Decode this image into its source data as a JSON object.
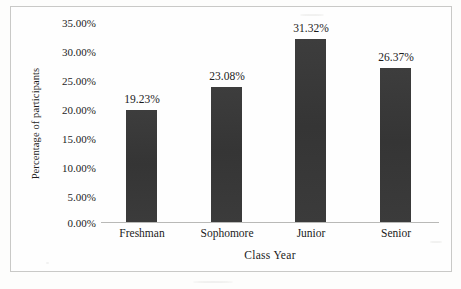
{
  "chart_data": {
    "type": "bar",
    "title": "",
    "xlabel": "Class Year",
    "ylabel": "Percentage of participants",
    "categories": [
      "Freshman",
      "Sophomore",
      "Junior",
      "Senior"
    ],
    "values": [
      19.23,
      23.08,
      31.32,
      26.37
    ],
    "value_labels": [
      "19.23%",
      "23.08%",
      "31.32%",
      "26.37%"
    ],
    "ytick_labels": [
      "35.00%",
      "30.00%",
      "25.00%",
      "20.00%",
      "15.00%",
      "10.00%",
      "5.00%",
      "0.00%"
    ],
    "ytick_values": [
      35,
      30,
      25,
      20,
      15,
      10,
      5,
      0
    ],
    "ylim": [
      0,
      35
    ],
    "grid": false,
    "legend": false,
    "bar_color": "#3a3a3a",
    "axis_color": "#b9b9b7",
    "text_color": "#1b1b1b",
    "background_color": "#fefefe"
  },
  "frame": {
    "border_color": "#c9c9c7"
  }
}
